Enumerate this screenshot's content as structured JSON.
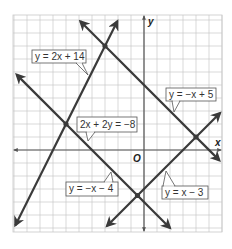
{
  "figure": {
    "type": "coordinate-plane-linear-system",
    "axes": {
      "x_label": "x",
      "y_label": "y",
      "origin_label": "O",
      "x_range": [
        -10,
        6
      ],
      "y_range": [
        -6.3,
        10.4
      ],
      "grid": true,
      "cell_px": 13,
      "origin_px": [
        144,
        150
      ]
    },
    "colors": {
      "line": "#3a3a3a",
      "grid": "#c8c8c8",
      "axis": "#555555",
      "label_border": "#555555",
      "label_bg": "#ffffff"
    },
    "lines": [
      {
        "id": "l1",
        "equation": "y = 2x + 14",
        "label": "y = 2x + 14",
        "slope": 2,
        "intercept": 14,
        "x_from": -9.9,
        "x_to": -2.05
      },
      {
        "id": "l2",
        "equation": "y = -x + 5",
        "label": "y = −x + 5",
        "slope": -1,
        "intercept": 5,
        "x_from": -4.9,
        "x_to": 5.8
      },
      {
        "id": "l3",
        "equation": "y = -x - 4",
        "label": "y = −x − 4",
        "slope": -1,
        "intercept": -4,
        "x_from": -9.8,
        "x_to": 2.0
      },
      {
        "id": "l4",
        "equation": "y = x - 3",
        "label": "y = x − 3",
        "slope": 1,
        "intercept": -3,
        "x_from": -2.85,
        "x_to": 5.85
      }
    ],
    "annotations": [
      {
        "text": "2x + 2y = −8",
        "refers_to": "l3"
      }
    ],
    "intersections": [
      {
        "lines": [
          "l1",
          "l2"
        ],
        "point": [
          -3,
          8
        ]
      },
      {
        "lines": [
          "l1",
          "l3"
        ],
        "point": [
          -6,
          2
        ]
      },
      {
        "lines": [
          "l2",
          "l4"
        ],
        "point": [
          4,
          1
        ]
      },
      {
        "lines": [
          "l3",
          "l4"
        ],
        "point": [
          -0.5,
          -3.5
        ]
      }
    ]
  },
  "labels": {
    "l1": "y = 2x + 14",
    "l2": "y = −x + 5",
    "l3": "y = −x − 4",
    "l4": "y = x − 3",
    "eq_alt": "2x + 2y = −8",
    "x_axis": "x",
    "y_axis": "y",
    "origin": "O"
  }
}
